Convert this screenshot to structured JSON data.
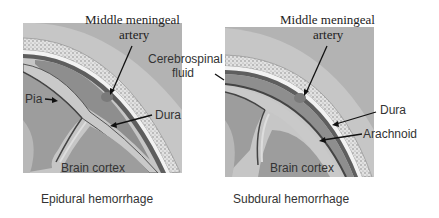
{
  "panels": [
    {
      "caption": "Epidural hemorrhage",
      "labels": {
        "artery_line1": "Middle meningeal",
        "artery_line2": "artery",
        "pia": "Pia",
        "dura": "Dura",
        "brain_cortex": "Brain cortex"
      }
    },
    {
      "caption": "Subdural hemorrhage",
      "labels": {
        "artery_line1": "Middle meningeal",
        "artery_line2": "artery",
        "csf_line1": "Cerebrospinal",
        "csf_line2": "fluid",
        "dura": "Dura",
        "arachnoid": "Arachnoid",
        "brain_cortex": "Brain cortex"
      }
    }
  ],
  "colors": {
    "scalp": "#c4c4c4",
    "skull": "#e6e6e6",
    "skull_speckle": "#8a8a8a",
    "dura": "#6b6b6b",
    "hemorrhage": "#8c8c8c",
    "csf": "#bdbdbd",
    "cortex": "#9a9a9a",
    "white_matter": "#b0b0b0",
    "outline": "#444444",
    "artery": "#7d7d7d"
  }
}
